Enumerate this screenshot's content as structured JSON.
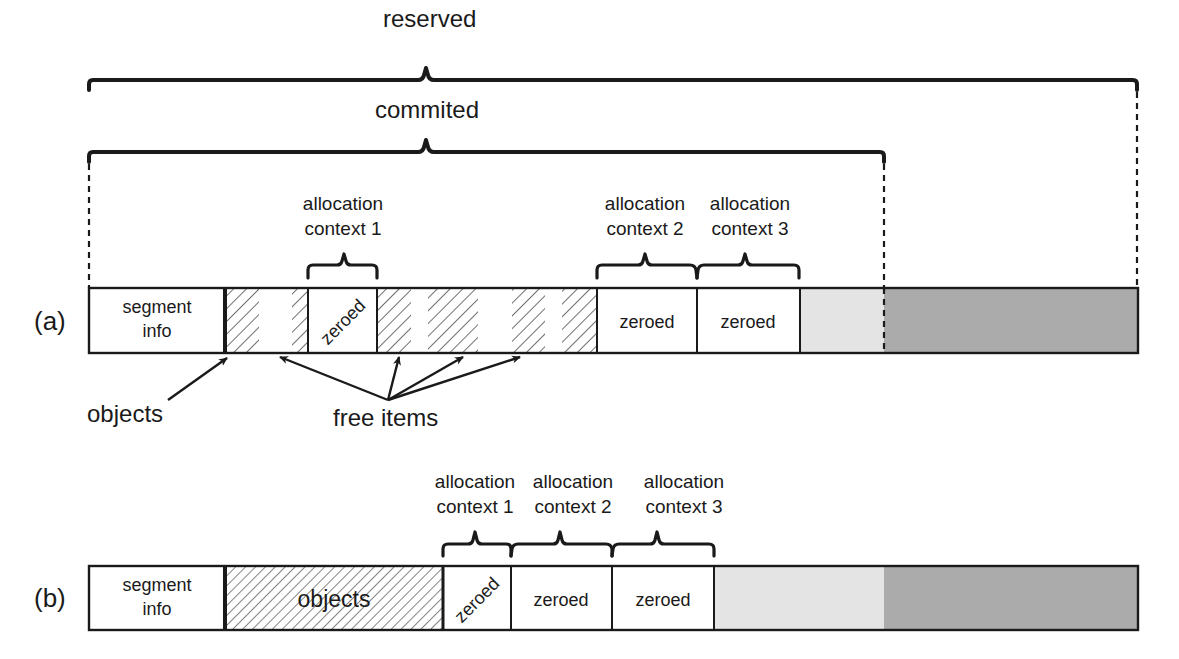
{
  "diagram": {
    "top_braces": {
      "reserved": {
        "label": "reserved"
      },
      "committed": {
        "label": "commited"
      }
    },
    "colors": {
      "stroke": "#1a1a1a",
      "background": "#ffffff",
      "committed_unused": "#e4e4e4",
      "reserved_uncommitted": "#ababab",
      "hatch": "#333333"
    },
    "row_a": {
      "label": "(a)",
      "segment_info": {
        "line1": "segment",
        "line2": "info"
      },
      "zeroed_rotated": "zeroed",
      "zeroed_2": "zeroed",
      "zeroed_3": "zeroed",
      "context_1": {
        "line1": "allocation",
        "line2": "context 1"
      },
      "context_2": {
        "line1": "allocation",
        "line2": "context 2"
      },
      "context_3": {
        "line1": "allocation",
        "line2": "context 3"
      },
      "annotations": {
        "objects": "objects",
        "free_items": "free items"
      }
    },
    "row_b": {
      "label": "(b)",
      "segment_info": {
        "line1": "segment",
        "line2": "info"
      },
      "objects": "objects",
      "zeroed_rotated": "zeroed",
      "zeroed_2": "zeroed",
      "zeroed_3": "zeroed",
      "context_1": {
        "line1": "allocation",
        "line2": "context 1"
      },
      "context_2": {
        "line1": "allocation",
        "line2": "context 2"
      },
      "context_3": {
        "line1": "allocation",
        "line2": "context 3"
      }
    }
  }
}
